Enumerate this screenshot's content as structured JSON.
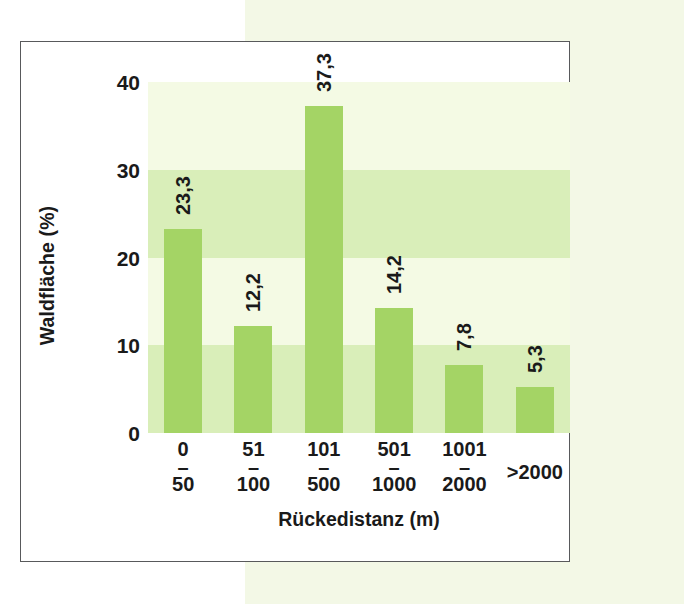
{
  "chart_data": {
    "type": "bar",
    "title": "",
    "xlabel": "Rückedistanz (m)",
    "ylabel": "Waldfläche (%)",
    "categories": [
      "0\n–\n50",
      "51\n–\n100",
      "101\n–\n500",
      "501\n–\n1000",
      "1001\n–\n2000",
      ">2000"
    ],
    "category_lines": [
      {
        "top": "0",
        "dash": "–",
        "bottom": "50"
      },
      {
        "top": "51",
        "dash": "–",
        "bottom": "100"
      },
      {
        "top": "101",
        "dash": "–",
        "bottom": "500"
      },
      {
        "top": "501",
        "dash": "–",
        "bottom": "1000"
      },
      {
        "top": "1001",
        "dash": "–",
        "bottom": "2000"
      },
      {
        "top": ">2000",
        "dash": "",
        "bottom": ""
      }
    ],
    "values": [
      23.3,
      12.2,
      37.3,
      14.2,
      7.8,
      5.3
    ],
    "value_labels": [
      "23,3",
      "12,2",
      "37,3",
      "14,2",
      "7,8",
      "5,3"
    ],
    "ylim": [
      0,
      40
    ],
    "yticks": [
      0,
      10,
      20,
      30,
      40
    ],
    "ytick_labels": [
      "0",
      "10",
      "20",
      "30",
      "40"
    ],
    "grid": false,
    "legend": "none",
    "bar_color": "#a4d465",
    "band_colors": [
      "#f4fae4",
      "#d9eeb9"
    ],
    "plot_background_bands": [
      {
        "from": 30,
        "to": 40,
        "color": "#f4fae4"
      },
      {
        "from": 20,
        "to": 30,
        "color": "#d9eeb9"
      },
      {
        "from": 10,
        "to": 20,
        "color": "#f4fae4"
      },
      {
        "from": 0,
        "to": 10,
        "color": "#d9eeb9"
      }
    ],
    "value_label_rotation_deg": 90,
    "ylabel_rotation_deg": 90
  },
  "axes": {
    "y_title": "Waldfläche (%)",
    "x_title": "Rückedistanz (m)"
  },
  "ytick_0": "0",
  "ytick_1": "10",
  "ytick_2": "20",
  "ytick_3": "30",
  "ytick_4": "40",
  "colors": {
    "page_tint": "#f3f8e6",
    "frame_border": "#58595b",
    "bar": "#a4d465",
    "band_pale": "#f4fae4",
    "band_mid": "#d9eeb9",
    "text": "#1a1a1a"
  }
}
